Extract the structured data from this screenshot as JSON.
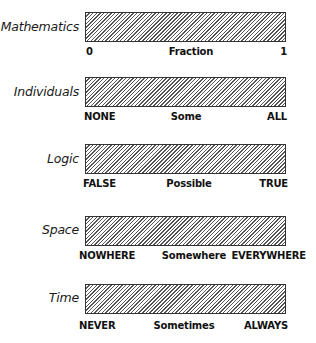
{
  "scales": [
    {
      "name": "Mathematics",
      "left": "0",
      "middle": "Fraction",
      "right": "1"
    },
    {
      "name": "Individuals",
      "left": "NONE",
      "middle": "Some",
      "right": "ALL"
    },
    {
      "name": "Logic",
      "left": "FALSE",
      "middle": "Possible",
      "right": "TRUE"
    },
    {
      "name": "Space",
      "left": "NOWHERE",
      "middle": "Somewhere",
      "right": "EVERYWHERE"
    },
    {
      "name": "Time",
      "left": "NEVER",
      "middle": "Sometimes",
      "right": "ALWAYS"
    }
  ],
  "colors": {
    "hatch": "#555555",
    "border": "#333333",
    "background": "#ffffff"
  }
}
